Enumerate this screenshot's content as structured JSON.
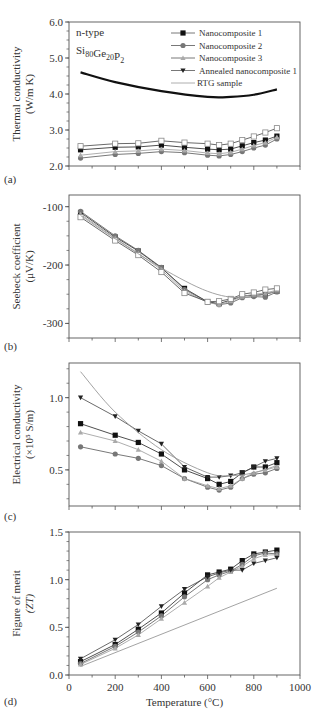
{
  "chart_data": [
    {
      "panel": "(a)",
      "type": "line",
      "title": "",
      "xlabel": "",
      "ylabel": "Thermal conductivity",
      "ylabel_unit": "(W/m K)",
      "xlim": [
        0,
        1000
      ],
      "ylim": [
        2.0,
        6.0
      ],
      "yticks": [
        2.0,
        3.0,
        4.0,
        5.0,
        6.0
      ],
      "ytick_labels": [
        "2.0",
        "3.0",
        "4.0",
        "5.0",
        "6.0"
      ],
      "annotation": {
        "line1": "n-type",
        "line2_base": "Si",
        "line2_parts": [
          [
            "Si",
            "80"
          ],
          [
            "Ge",
            "20"
          ],
          [
            "P",
            "2"
          ]
        ]
      },
      "legend": [
        "Nanocomposite 1",
        "Nanocomposite 2",
        "Nanocomposite 3",
        "Annealed nanocomposite 1",
        "RTG sample"
      ],
      "x": [
        50,
        200,
        300,
        400,
        500,
        600,
        650,
        700,
        750,
        800,
        850,
        900
      ],
      "series": [
        {
          "name": "Nanocomposite 1",
          "marker": "square-filled",
          "values": [
            2.45,
            2.52,
            2.53,
            2.58,
            2.52,
            2.47,
            2.45,
            2.47,
            2.56,
            2.65,
            2.72,
            2.83
          ]
        },
        {
          "name": "Nanocomposite 2",
          "marker": "circle-filled",
          "values": [
            2.22,
            2.32,
            2.35,
            2.4,
            2.37,
            2.3,
            2.28,
            2.32,
            2.4,
            2.5,
            2.58,
            2.75
          ]
        },
        {
          "name": "Nanocomposite 3",
          "marker": "triangle-up",
          "values": [
            2.3,
            2.4,
            2.42,
            2.47,
            2.43,
            2.36,
            2.34,
            2.38,
            2.47,
            2.57,
            2.65,
            2.8
          ]
        },
        {
          "name": "Annealed nanocomposite 1",
          "marker": "square-open",
          "values": [
            2.55,
            2.62,
            2.63,
            2.7,
            2.65,
            2.62,
            2.58,
            2.62,
            2.72,
            2.82,
            2.93,
            3.05
          ]
        },
        {
          "name": "RTG sample",
          "marker": "none",
          "x": [
            50,
            200,
            400,
            600,
            700,
            800,
            900
          ],
          "values": [
            4.6,
            4.33,
            4.08,
            3.92,
            3.92,
            3.98,
            4.13
          ]
        }
      ]
    },
    {
      "panel": "(b)",
      "type": "line",
      "ylabel": "Seebeck coefficient",
      "ylabel_unit": "(μV/K)",
      "xlim": [
        0,
        1000
      ],
      "ylim": [
        -325,
        -80
      ],
      "yticks": [
        -100,
        -200,
        -300
      ],
      "ytick_labels": [
        "-100",
        "-200",
        "-300"
      ],
      "x": [
        50,
        200,
        300,
        400,
        500,
        600,
        650,
        700,
        750,
        800,
        850,
        900
      ],
      "series": [
        {
          "name": "Nanocomposite 1",
          "marker": "square-filled",
          "values": [
            -110,
            -152,
            -176,
            -205,
            -240,
            -263,
            -266,
            -260,
            -253,
            -252,
            -250,
            -245
          ]
        },
        {
          "name": "Nanocomposite 2",
          "marker": "circle-filled",
          "values": [
            -108,
            -150,
            -175,
            -204,
            -242,
            -263,
            -268,
            -265,
            -256,
            -254,
            -255,
            -246
          ]
        },
        {
          "name": "Nanocomposite 3",
          "marker": "triangle-up",
          "values": [
            -113,
            -154,
            -180,
            -208,
            -245,
            -264,
            -268,
            -262,
            -254,
            -250,
            -248,
            -243
          ]
        },
        {
          "name": "Annealed nanocomposite 1",
          "marker": "square-open",
          "values": [
            -118,
            -158,
            -183,
            -212,
            -248,
            -263,
            -262,
            -258,
            -250,
            -247,
            -242,
            -240
          ]
        },
        {
          "name": "RTG sample",
          "marker": "none",
          "x": [
            50,
            200,
            400,
            600,
            750,
            900
          ],
          "values": [
            -115,
            -155,
            -205,
            -245,
            -256,
            -245
          ]
        }
      ]
    },
    {
      "panel": "(c)",
      "type": "line",
      "ylabel": "Electrical conductivity",
      "ylabel_unit": "(×10⁵ S/m)",
      "xlim": [
        0,
        1000
      ],
      "ylim": [
        0.25,
        1.24
      ],
      "yticks": [
        0.5,
        1.0
      ],
      "ytick_labels": [
        "0.5",
        "1.0"
      ],
      "x": [
        50,
        200,
        300,
        400,
        500,
        600,
        650,
        700,
        750,
        800,
        850,
        900
      ],
      "series": [
        {
          "name": "Nanocomposite 1",
          "marker": "square-filled",
          "values": [
            0.82,
            0.74,
            0.69,
            0.61,
            0.5,
            0.44,
            0.4,
            0.42,
            0.48,
            0.52,
            0.52,
            0.55
          ]
        },
        {
          "name": "Nanocomposite 2",
          "marker": "circle-filled",
          "values": [
            0.66,
            0.61,
            0.58,
            0.53,
            0.44,
            0.38,
            0.36,
            0.38,
            0.44,
            0.47,
            0.48,
            0.51
          ]
        },
        {
          "name": "Nanocomposite 3",
          "marker": "triangle-up",
          "values": [
            0.76,
            0.7,
            0.64,
            0.56,
            0.44,
            0.39,
            0.37,
            0.39,
            0.44,
            0.48,
            0.5,
            0.52
          ]
        },
        {
          "name": "Annealed nanocomposite 1",
          "marker": "triangle-down",
          "values": [
            1.0,
            0.87,
            0.77,
            0.68,
            0.52,
            0.45,
            0.45,
            0.46,
            0.48,
            0.52,
            0.56,
            0.58
          ]
        },
        {
          "name": "RTG sample",
          "marker": "none",
          "x": [
            50,
            200,
            400,
            600,
            700,
            800,
            900
          ],
          "values": [
            1.18,
            0.9,
            0.64,
            0.48,
            0.46,
            0.48,
            0.53
          ]
        }
      ]
    },
    {
      "panel": "(d)",
      "type": "line",
      "xlabel": "Temperature (°C)",
      "ylabel": "Figure of merit",
      "ylabel_unit": "(ZT)",
      "xlim": [
        0,
        1000
      ],
      "ylim": [
        0.0,
        1.5
      ],
      "xticks": [
        0,
        200,
        400,
        600,
        800,
        1000
      ],
      "xtick_labels": [
        "0",
        "200",
        "400",
        "600",
        "800",
        "1000"
      ],
      "yticks": [
        0.0,
        0.5,
        1.0,
        1.5
      ],
      "ytick_labels": [
        "0.0",
        "0.5",
        "1.0",
        "1.5"
      ],
      "x": [
        50,
        200,
        300,
        400,
        500,
        600,
        650,
        700,
        750,
        800,
        850,
        900
      ],
      "series": [
        {
          "name": "Nanocomposite 1",
          "marker": "square-filled",
          "values": [
            0.14,
            0.32,
            0.48,
            0.65,
            0.86,
            1.05,
            1.08,
            1.11,
            1.2,
            1.27,
            1.29,
            1.31
          ]
        },
        {
          "name": "Nanocomposite 2",
          "marker": "circle-filled",
          "values": [
            0.12,
            0.3,
            0.45,
            0.62,
            0.82,
            1.0,
            1.05,
            1.09,
            1.16,
            1.25,
            1.28,
            1.27
          ]
        },
        {
          "name": "Nanocomposite 3",
          "marker": "triangle-up",
          "values": [
            0.11,
            0.28,
            0.42,
            0.59,
            0.76,
            0.93,
            1.02,
            1.08,
            1.14,
            1.22,
            1.26,
            1.26
          ]
        },
        {
          "name": "Annealed nanocomposite 1",
          "marker": "triangle-down",
          "values": [
            0.17,
            0.37,
            0.53,
            0.72,
            0.9,
            1.03,
            1.07,
            1.1,
            1.1,
            1.17,
            1.2,
            1.23
          ]
        },
        {
          "name": "RTG sample",
          "marker": "none",
          "x": [
            50,
            900
          ],
          "values": [
            0.09,
            0.91
          ]
        }
      ]
    }
  ]
}
